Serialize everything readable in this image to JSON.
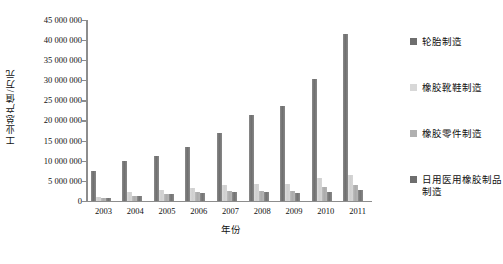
{
  "chart_data": {
    "type": "bar",
    "title": "",
    "xlabel": "年份",
    "ylabel": "工业总产值/万元",
    "ylim": [
      0,
      45000000
    ],
    "ytick_step": 5000000,
    "grid": false,
    "legend_position": "right",
    "categories": [
      "2003",
      "2004",
      "2005",
      "2006",
      "2007",
      "2008",
      "2009",
      "2010",
      "2011"
    ],
    "ytick_labels": [
      "45 000 000",
      "40 000 000",
      "35 000 000",
      "30 000 000",
      "25 000 000",
      "20 000 000",
      "15 000 000",
      "10 000 000",
      "5 000 000",
      "0"
    ],
    "series": [
      {
        "name": "轮胎制造",
        "color": "#6e6e6e",
        "values": [
          7500000,
          9800000,
          11200000,
          13500000,
          17000000,
          21300000,
          23500000,
          30300000,
          41500000
        ]
      },
      {
        "name": "橡胶靴鞋制造",
        "color": "#d8d8d8",
        "values": [
          1000000,
          2100000,
          2800000,
          3300000,
          3900000,
          4300000,
          4300000,
          5800000,
          6500000
        ]
      },
      {
        "name": "橡胶零件制造",
        "color": "#b0b0b0",
        "values": [
          700000,
          1200000,
          1600000,
          2100000,
          2500000,
          2500000,
          2400000,
          3400000,
          3900000
        ]
      },
      {
        "name": "日用医用橡胶制品制造",
        "color": "#6e6e6e",
        "values": [
          600000,
          1300000,
          1600000,
          1900000,
          2100000,
          2100000,
          2000000,
          2200000,
          2600000
        ]
      }
    ]
  },
  "legend": {
    "items": [
      {
        "label": "轮胎制造"
      },
      {
        "label": "橡胶靴鞋制造"
      },
      {
        "label": "橡胶零件制造"
      },
      {
        "label": "日用医用橡胶制品制造"
      }
    ]
  }
}
